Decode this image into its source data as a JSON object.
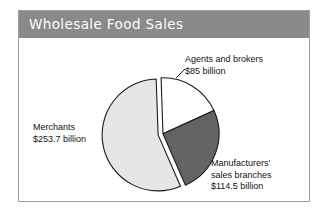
{
  "figure": {
    "title": "Wholesale Food Sales",
    "banner_color": "#8a8a8a",
    "frame_color": "#9d9d9d",
    "background": "#ffffff"
  },
  "chart_data": {
    "type": "pie",
    "title": "Wholesale Food Sales",
    "unit": "billion USD",
    "total": 453.2,
    "exploded_slice": "Merchants",
    "legend": "none (direct callout labels)",
    "grid": false,
    "categories": [
      "Merchants",
      "Agents and brokers",
      "Manufacturers' sales branches"
    ],
    "values": [
      253.7,
      85,
      114.5
    ],
    "percentages": [
      55.98,
      18.76,
      25.26
    ],
    "colors": [
      "#e6e6e6",
      "#ffffff",
      "#636363"
    ],
    "slices": [
      {
        "name": "Merchants",
        "value": 253.7,
        "value_label": "$253.7 billion",
        "percent": 55.98,
        "color": "#e6e6e6",
        "exploded": true
      },
      {
        "name": "Agents and brokers",
        "value": 85,
        "value_label": "$85 billion",
        "percent": 18.76,
        "color": "#ffffff",
        "exploded": false
      },
      {
        "name": "Manufacturers' sales branches",
        "value": 114.5,
        "value_label": "$114.5 billion",
        "percent": 25.26,
        "color": "#636363",
        "exploded": false
      }
    ]
  },
  "labels": {
    "agents": {
      "line1": "Agents and brokers",
      "line2": "$85 billion"
    },
    "merchants": {
      "line1": "Merchants",
      "line2": "$253.7 billion"
    },
    "manufacturers": {
      "line1": "Manufacturers'",
      "line2": "sales branches",
      "line3": "$114.5 billion"
    }
  }
}
